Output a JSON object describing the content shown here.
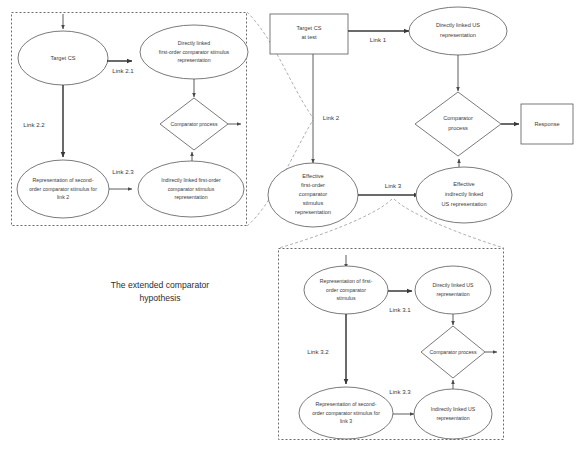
{
  "figure": {
    "caption_line1": "The extended comparator",
    "caption_line2": "hypothesis"
  },
  "panels": {
    "link2_panel": {
      "name": "Link 2 expansion panel",
      "nodes": {
        "target_cs": "Target CS",
        "directly_linked_l1": "Directly linked",
        "directly_linked_l2": "first-order comparator stimulus",
        "directly_linked_l3": "representation",
        "comparator_process": "Comparator process",
        "second_order_l1": "Representation of second-",
        "second_order_l2": "order comparator stimulus for",
        "second_order_l3": "link 2",
        "indirectly_linked_l1": "Indirectly linked first-order",
        "indirectly_linked_l2": "comparator stimulus",
        "indirectly_linked_l3": "representation"
      },
      "links": {
        "link_2_1": "Link 2.1",
        "link_2_2": "Link 2.2",
        "link_2_3": "Link 2.3"
      }
    },
    "main_panel": {
      "name": "Main comparator hypothesis panel",
      "nodes": {
        "target_cs_at_test_l1": "Target CS",
        "target_cs_at_test_l2": "at test",
        "directly_linked_us_l1": "Directly linked US",
        "directly_linked_us_l2": "representation",
        "comparator_process_l1": "Comparator",
        "comparator_process_l2": "process",
        "response": "Response",
        "effective_first_order_l1": "Effective",
        "effective_first_order_l2": "first-order",
        "effective_first_order_l3": "comparator",
        "effective_first_order_l4": "stimulus",
        "effective_first_order_l5": "representation",
        "effective_indirect_l1": "Effective",
        "effective_indirect_l2": "indirectly linked",
        "effective_indirect_l3": "US representation"
      },
      "links": {
        "link_1": "Link 1",
        "link_2": "Link 2",
        "link_3": "Link 3"
      }
    },
    "link3_panel": {
      "name": "Link 3 expansion panel",
      "nodes": {
        "first_order_l1": "Representation of first-",
        "first_order_l2": "order comparator",
        "first_order_l3": "stimulus",
        "directly_linked_us_l1": "Directly linked US",
        "directly_linked_us_l2": "representation",
        "comparator_process": "Comparator process",
        "second_order_l1": "Representation of second-",
        "second_order_l2": "order comparator stimulus for",
        "second_order_l3": "link 3",
        "indirectly_linked_us_l1": "Indirectly linked US",
        "indirectly_linked_us_l2": "representation"
      },
      "links": {
        "link_3_1": "Link 3.1",
        "link_3_2": "Link 3.2",
        "link_3_3": "Link 3.3"
      }
    }
  },
  "colors": {
    "stroke": "#58585a",
    "panel_border": "#6b6b6d",
    "callout": "#9a9a9c",
    "text": "#3a3a3c",
    "background": "#ffffff"
  }
}
